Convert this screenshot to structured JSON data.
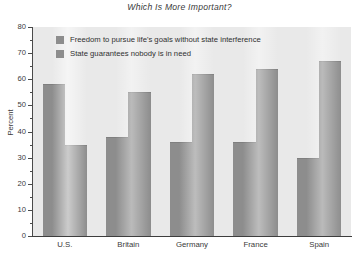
{
  "chart_data": {
    "type": "bar",
    "title": "Which Is More Important?",
    "xlabel": "",
    "ylabel": "Percent",
    "ylim": [
      0,
      80
    ],
    "ytick_step": 10,
    "yticks": [
      0,
      10,
      20,
      30,
      40,
      50,
      60,
      70,
      80
    ],
    "ytick_labels": [
      "0",
      "10",
      "20",
      "30",
      "40",
      "50",
      "60",
      "70",
      "80"
    ],
    "minor_tick_step": 5,
    "grid": false,
    "legend_position": "upper left (inside plot)",
    "categories": [
      "U.S.",
      "Britain",
      "Germany",
      "France",
      "Spain"
    ],
    "series": [
      {
        "name": "Freedom to pursue life's goals without state interference",
        "color": "#8d8d8d",
        "values": [
          58,
          38,
          36,
          36,
          30
        ]
      },
      {
        "name": "State guarantees nobody is in need",
        "color": "#8d8d8d",
        "values": [
          35,
          55,
          62,
          64,
          67
        ]
      }
    ]
  },
  "colors": {
    "bar": "#8d8d8d",
    "plot_background": "#e9e9e9",
    "axis": "#4a4a4a",
    "text": "#3a3a3a",
    "page_background": "#ffffff"
  },
  "footer": {
    "note": ""
  }
}
